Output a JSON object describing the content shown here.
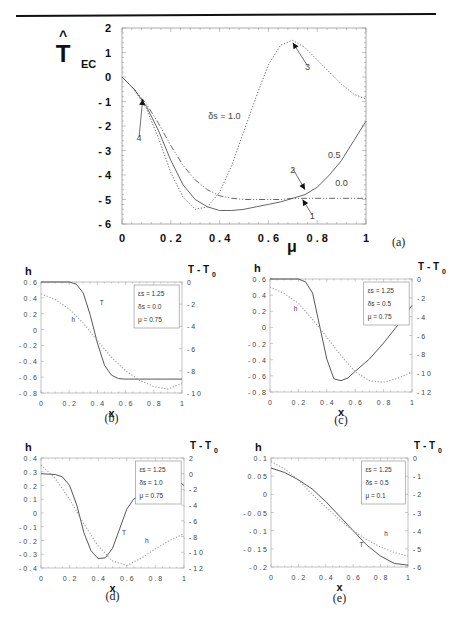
{
  "figure": {
    "top_rule": true,
    "panels": [
      "a",
      "b",
      "c",
      "d",
      "e"
    ]
  },
  "chart_data": [
    {
      "id": "a",
      "type": "line",
      "caption": "(a)",
      "title": "",
      "ylabel": "T_EC (hat)",
      "ylabel_main": "T",
      "ylabel_sub": "EC",
      "ylabel_hat": "^",
      "xlabel": "μ",
      "xlim": [
        0,
        1
      ],
      "ylim": [
        -6,
        2
      ],
      "xticks": [
        0,
        0.2,
        0.4,
        0.6,
        0.8,
        1
      ],
      "xtick_labels": [
        "0",
        "0 . 2",
        "0 . 4",
        "0 . 6",
        "0 . 8",
        "1"
      ],
      "yticks": [
        2,
        1,
        0,
        -1,
        -2,
        -3,
        -4,
        -5,
        -6
      ],
      "ytick_labels": [
        "2",
        "1",
        "0",
        "- 1",
        "- 2",
        "- 3",
        "- 4",
        "- 5",
        "- 6"
      ],
      "grid": false,
      "series": [
        {
          "name": "δs = 1.0",
          "style": "dotted",
          "x": [
            0,
            0.05,
            0.1,
            0.15,
            0.2,
            0.25,
            0.3,
            0.35,
            0.4,
            0.45,
            0.5,
            0.55,
            0.6,
            0.65,
            0.7,
            0.75,
            0.8,
            0.85,
            0.9,
            0.95,
            1.0
          ],
          "y": [
            0,
            -0.5,
            -1.3,
            -2.5,
            -3.9,
            -4.9,
            -5.4,
            -5.3,
            -4.7,
            -3.6,
            -2.2,
            -0.8,
            0.5,
            1.3,
            1.5,
            1.2,
            0.7,
            0.2,
            -0.3,
            -0.7,
            -0.9
          ]
        },
        {
          "name": "0.5",
          "style": "solid",
          "x": [
            0,
            0.05,
            0.1,
            0.15,
            0.2,
            0.25,
            0.3,
            0.35,
            0.4,
            0.45,
            0.5,
            0.55,
            0.6,
            0.65,
            0.7,
            0.75,
            0.8,
            0.85,
            0.9,
            0.95,
            1.0
          ],
          "y": [
            0,
            -0.5,
            -1.2,
            -2.2,
            -3.4,
            -4.4,
            -5.0,
            -5.3,
            -5.45,
            -5.45,
            -5.4,
            -5.3,
            -5.2,
            -5.1,
            -4.95,
            -4.8,
            -4.5,
            -4.0,
            -3.4,
            -2.6,
            -1.8
          ]
        },
        {
          "name": "0.0",
          "style": "dashdot",
          "x": [
            0,
            0.05,
            0.1,
            0.15,
            0.2,
            0.25,
            0.3,
            0.35,
            0.4,
            0.45,
            0.5,
            0.55,
            0.6,
            0.65,
            0.7,
            0.75,
            0.8,
            0.85,
            0.9,
            0.95,
            1.0
          ],
          "y": [
            0,
            -0.5,
            -1.1,
            -1.9,
            -2.8,
            -3.6,
            -4.2,
            -4.6,
            -4.85,
            -4.95,
            -5.0,
            -5.0,
            -5.0,
            -5.0,
            -4.95,
            -4.95,
            -4.95,
            -4.95,
            -4.95,
            -4.95,
            -4.95
          ]
        }
      ],
      "annotations": [
        {
          "text": "δs = 1.0",
          "x": 0.42,
          "y": -1.7
        },
        {
          "text": "0.5",
          "x": 0.87,
          "y": -3.3
        },
        {
          "text": "0.0",
          "x": 0.9,
          "y": -4.45
        },
        {
          "text": "1",
          "x": 0.78,
          "y": -5.8,
          "arrow_to": [
            0.74,
            -5.0
          ]
        },
        {
          "text": "2",
          "x": 0.7,
          "y": -3.9,
          "arrow_to": [
            0.75,
            -4.6
          ]
        },
        {
          "text": "3",
          "x": 0.76,
          "y": 0.3,
          "arrow_to": [
            0.7,
            1.4
          ]
        },
        {
          "text": "4",
          "x": 0.07,
          "y": -2.6,
          "arrow_to": [
            0.085,
            -0.9
          ]
        }
      ]
    },
    {
      "id": "b",
      "type": "line",
      "caption": "(b)",
      "xlabel": "x",
      "ylabel_left": "h",
      "ylabel_right": "T - T0",
      "xlim": [
        0,
        1
      ],
      "ylim_left": [
        -0.8,
        0.6
      ],
      "ylim_right": [
        -10,
        0
      ],
      "xticks": [
        0,
        0.2,
        0.4,
        0.6,
        0.8,
        1
      ],
      "xtick_labels": [
        "0",
        "0 . 2",
        "0 . 4",
        "0 . 6",
        "0 . 8",
        "1"
      ],
      "yticks_left": [
        0.6,
        0.4,
        0.2,
        0,
        -0.2,
        -0.4,
        -0.6,
        -0.8
      ],
      "ytick_labels_left": [
        "0 . 6",
        "0 . 4",
        "0 . 2",
        "0",
        "- 0 . 2",
        "- 0 . 4",
        "- 0 . 6",
        "- 0 . 8"
      ],
      "yticks_right": [
        0,
        -2,
        -4,
        -6,
        -8,
        -10
      ],
      "ytick_labels_right": [
        "0",
        "- 2",
        "- 4",
        "- 6",
        "- 8",
        "- 1 0"
      ],
      "legend": [
        "εs = 1.25",
        "δs = 0.0",
        "μ = 0.75"
      ],
      "series": [
        {
          "name": "T",
          "axis": "right",
          "style": "solid",
          "x": [
            0,
            0.1,
            0.2,
            0.25,
            0.3,
            0.35,
            0.4,
            0.45,
            0.5,
            0.55,
            0.6,
            0.7,
            0.8,
            0.9,
            1.0
          ],
          "y": [
            0,
            0,
            0,
            -0.2,
            -1.0,
            -3.0,
            -5.5,
            -7.5,
            -8.4,
            -8.7,
            -8.75,
            -8.75,
            -8.75,
            -8.75,
            -8.75
          ]
        },
        {
          "name": "h",
          "axis": "left",
          "style": "dotted",
          "x": [
            0,
            0.1,
            0.2,
            0.3,
            0.4,
            0.5,
            0.6,
            0.7,
            0.8,
            0.9,
            1.0
          ],
          "y": [
            0.45,
            0.38,
            0.26,
            0.08,
            -0.14,
            -0.35,
            -0.52,
            -0.64,
            -0.72,
            -0.75,
            -0.68
          ]
        }
      ],
      "curve_labels": [
        {
          "text": "T",
          "x": 0.43,
          "y_right": -2.1
        },
        {
          "text": "h",
          "x": 0.23,
          "y_left": 0.1
        }
      ]
    },
    {
      "id": "c",
      "type": "line",
      "caption": "(c)",
      "xlabel": "x",
      "ylabel_left": "h",
      "ylabel_right": "T - T0",
      "xlim": [
        0,
        1
      ],
      "ylim_left": [
        -0.8,
        0.6
      ],
      "ylim_right": [
        -12,
        0
      ],
      "xticks": [
        0,
        0.2,
        0.4,
        0.6,
        0.8,
        1
      ],
      "xtick_labels": [
        "0",
        "0 . 2",
        "0 . 4",
        "0 . 6",
        "0 . 8",
        "1"
      ],
      "yticks_left": [
        0.6,
        0.4,
        0.2,
        0,
        -0.2,
        -0.4,
        -0.6,
        -0.8
      ],
      "ytick_labels_left": [
        "0 . 6",
        "0 . 4",
        "0 . 2",
        "0",
        "- 0 . 2",
        "- 0 . 4",
        "- 0 . 6",
        "- 0 . 8"
      ],
      "yticks_right": [
        0,
        -2,
        -4,
        -6,
        -8,
        -10,
        -12
      ],
      "ytick_labels_right": [
        "0",
        "- 2",
        "- 4",
        "- 6",
        "- 8",
        "- 1 0",
        "- 1 2"
      ],
      "legend": [
        "εs = 1.25",
        "δs = 0.5",
        "μ = 0.75"
      ],
      "series": [
        {
          "name": "T",
          "axis": "right",
          "style": "solid",
          "x": [
            0,
            0.1,
            0.2,
            0.25,
            0.3,
            0.35,
            0.4,
            0.45,
            0.5,
            0.55,
            0.6,
            0.7,
            0.8,
            0.9,
            1.0
          ],
          "y": [
            0,
            0,
            0,
            -0.3,
            -1.5,
            -5.0,
            -8.5,
            -10.6,
            -10.8,
            -10.5,
            -9.8,
            -8.5,
            -6.8,
            -4.9,
            -2.8
          ]
        },
        {
          "name": "h",
          "axis": "left",
          "style": "dotted",
          "x": [
            0,
            0.1,
            0.2,
            0.3,
            0.4,
            0.5,
            0.6,
            0.7,
            0.8,
            0.9,
            1.0
          ],
          "y": [
            0.5,
            0.42,
            0.3,
            0.1,
            -0.12,
            -0.35,
            -0.55,
            -0.66,
            -0.68,
            -0.63,
            -0.55
          ]
        }
      ],
      "curve_labels": [
        {
          "text": "T",
          "x": 0.88,
          "y_right": -5.0
        },
        {
          "text": "h",
          "x": 0.18,
          "y_left": 0.2
        }
      ]
    },
    {
      "id": "d",
      "type": "line",
      "caption": "(d)",
      "xlabel": "x",
      "ylabel_left": "h",
      "ylabel_right": "T - T0",
      "xlim": [
        0,
        1
      ],
      "ylim_left": [
        -0.4,
        0.4
      ],
      "ylim_right": [
        -12,
        2
      ],
      "xticks": [
        0,
        0.2,
        0.4,
        0.6,
        0.8,
        1
      ],
      "xtick_labels": [
        "0",
        "0 . 2",
        "0 . 4",
        "0 . 6",
        "0 . 8",
        "1"
      ],
      "yticks_left": [
        0.4,
        0.3,
        0.2,
        0.1,
        0,
        -0.1,
        -0.2,
        -0.3,
        -0.4
      ],
      "ytick_labels_left": [
        "0 . 4",
        "0 . 3",
        "0 . 2",
        "0 . 1",
        "0",
        "- 0 . 1",
        "- 0 . 2",
        "- 0 . 3",
        "- 0 . 4"
      ],
      "yticks_right": [
        2,
        0,
        -2,
        -4,
        -6,
        -8,
        -10,
        -12
      ],
      "ytick_labels_right": [
        "2",
        "0",
        "- 2",
        "- 4",
        "- 6",
        "- 8",
        "- 1 0",
        "- 1 2"
      ],
      "legend": [
        "εs = 1.25",
        "δs = 1.0",
        "μ = 0.75"
      ],
      "series": [
        {
          "name": "T",
          "axis": "right",
          "style": "solid",
          "x": [
            0,
            0.1,
            0.15,
            0.2,
            0.25,
            0.3,
            0.35,
            0.4,
            0.45,
            0.5,
            0.55,
            0.6,
            0.65,
            0.7,
            0.75,
            0.8,
            0.85,
            0.9,
            0.95,
            1.0
          ],
          "y": [
            0,
            -0.1,
            -0.4,
            -1.5,
            -4.0,
            -7.5,
            -9.8,
            -10.8,
            -10.7,
            -9.5,
            -7.0,
            -4.5,
            -3.2,
            -2.8,
            -2.2,
            -0.6,
            0,
            0,
            -0.8,
            -1.5
          ]
        },
        {
          "name": "h",
          "axis": "left",
          "style": "dotted",
          "x": [
            0,
            0.1,
            0.2,
            0.3,
            0.4,
            0.5,
            0.6,
            0.7,
            0.8,
            0.9,
            1.0
          ],
          "y": [
            0.35,
            0.25,
            0.1,
            -0.08,
            -0.24,
            -0.35,
            -0.38,
            -0.33,
            -0.26,
            -0.2,
            -0.15
          ]
        }
      ],
      "curve_labels": [
        {
          "text": "T",
          "x": 0.58,
          "y_right": -7.8
        },
        {
          "text": "h",
          "x": 0.74,
          "y_left": -0.22
        }
      ]
    },
    {
      "id": "e",
      "type": "line",
      "caption": "(e)",
      "xlabel": "x",
      "ylabel_left": "h",
      "ylabel_right": "T - T0",
      "xlim": [
        0,
        1
      ],
      "ylim_left": [
        -0.2,
        0.1
      ],
      "ylim_right": [
        -6,
        0
      ],
      "xticks": [
        0,
        0.2,
        0.4,
        0.6,
        0.8,
        1
      ],
      "xtick_labels": [
        "0",
        "0 . 2",
        "0 . 4",
        "0 . 6",
        "0 . 8",
        "1"
      ],
      "yticks_left": [
        0.1,
        0.05,
        0,
        -0.05,
        -0.1,
        -0.15,
        -0.2
      ],
      "ytick_labels_left": [
        "0 . 1",
        "0 . 0 5",
        "0",
        "- 0 . 0 5",
        "- 0 . 1",
        "- 0 . 1 5",
        "- 0 . 2"
      ],
      "yticks_right": [
        0,
        -1,
        -2,
        -3,
        -4,
        -5,
        -6
      ],
      "ytick_labels_right": [
        "0",
        "- 1",
        "- 2",
        "- 3",
        "- 4",
        "- 5",
        "- 6"
      ],
      "legend": [
        "εs = 1.25",
        "δs = 0.5",
        "μ = 0.1"
      ],
      "series": [
        {
          "name": "T",
          "axis": "right",
          "style": "solid",
          "x": [
            0,
            0.1,
            0.2,
            0.3,
            0.4,
            0.5,
            0.6,
            0.7,
            0.8,
            0.9,
            1.0
          ],
          "y": [
            -0.55,
            -0.8,
            -1.2,
            -1.7,
            -2.4,
            -3.2,
            -4.0,
            -4.8,
            -5.4,
            -5.8,
            -5.9
          ]
        },
        {
          "name": "h",
          "axis": "left",
          "style": "dotted",
          "x": [
            0,
            0.1,
            0.2,
            0.3,
            0.4,
            0.5,
            0.6,
            0.7,
            0.8,
            0.9,
            1.0
          ],
          "y": [
            0.09,
            0.07,
            0.04,
            0.0,
            -0.035,
            -0.07,
            -0.1,
            -0.125,
            -0.145,
            -0.16,
            -0.17
          ]
        }
      ],
      "curve_labels": [
        {
          "text": "T",
          "x": 0.66,
          "y_left": -0.145
        },
        {
          "text": "h",
          "x": 0.84,
          "y_left": -0.115
        }
      ]
    }
  ]
}
